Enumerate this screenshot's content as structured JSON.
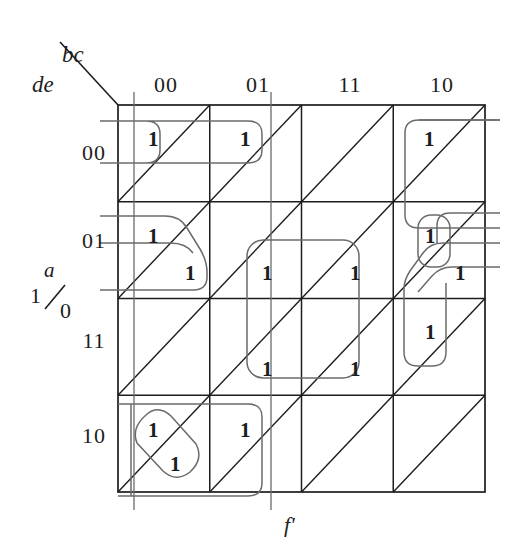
{
  "diagram": {
    "type": "karnaugh-map",
    "title_function": "f'",
    "column_variable": "bc",
    "row_variable": "de",
    "entered_variable": "a",
    "entered_variable_high": "1",
    "entered_variable_low": "0",
    "column_headers": [
      "00",
      "01",
      "11",
      "10"
    ],
    "row_headers": [
      "00",
      "01",
      "11",
      "10"
    ],
    "cell_value": "1",
    "ink_color": "#1d1d1d",
    "group_color": "#6b6b6b"
  },
  "cells": [
    {
      "row": "00",
      "col": "00",
      "upper": "1",
      "lower": ""
    },
    {
      "row": "00",
      "col": "01",
      "upper": "1",
      "lower": ""
    },
    {
      "row": "00",
      "col": "11",
      "upper": "",
      "lower": ""
    },
    {
      "row": "00",
      "col": "10",
      "upper": "1",
      "lower": ""
    },
    {
      "row": "01",
      "col": "00",
      "upper": "1",
      "lower": "1"
    },
    {
      "row": "01",
      "col": "01",
      "upper": "",
      "lower": "1"
    },
    {
      "row": "01",
      "col": "11",
      "upper": "",
      "lower": "1"
    },
    {
      "row": "01",
      "col": "10",
      "upper": "1",
      "lower": "1"
    },
    {
      "row": "11",
      "col": "00",
      "upper": "",
      "lower": ""
    },
    {
      "row": "11",
      "col": "01",
      "upper": "",
      "lower": "1"
    },
    {
      "row": "11",
      "col": "11",
      "upper": "",
      "lower": "1"
    },
    {
      "row": "11",
      "col": "10",
      "upper": "1",
      "lower": ""
    },
    {
      "row": "10",
      "col": "00",
      "upper": "1",
      "lower": "1"
    },
    {
      "row": "10",
      "col": "01",
      "upper": "1",
      "lower": ""
    },
    {
      "row": "10",
      "col": "11",
      "upper": "",
      "lower": ""
    },
    {
      "row": "10",
      "col": "10",
      "upper": "",
      "lower": ""
    }
  ],
  "groups": [
    {
      "id": "g-top-left-pair",
      "note": "row 00, cols 00+01 upper triangles"
    },
    {
      "id": "g-right-column",
      "note": "col 10, rows 00-01-11 upper triangles"
    },
    {
      "id": "g-left-step",
      "note": "col 00, row 01 upper + lower"
    },
    {
      "id": "g-center-quad",
      "note": "rows 01+11, cols 01+11 lower triangles"
    },
    {
      "id": "g-right-small",
      "note": "col 10, row 01 upper"
    },
    {
      "id": "g-right-step",
      "note": "col 10, row 01 upper + lower"
    },
    {
      "id": "g-bottom-oval",
      "note": "col 00, row 10 upper + lower (diagonal)"
    },
    {
      "id": "g-bottom-pair",
      "note": "row 10, cols 00+01 upper triangles"
    }
  ]
}
